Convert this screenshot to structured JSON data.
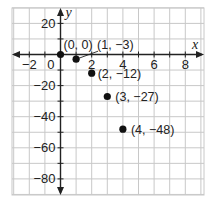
{
  "chart_data": {
    "type": "scatter",
    "title": "",
    "xlabel": "x",
    "ylabel": "y",
    "xlim": [
      -3,
      9
    ],
    "ylim": [
      -90,
      30
    ],
    "grid": true,
    "x_step": 1,
    "y_step": 10,
    "x_ticks": [
      -2,
      2,
      4,
      6,
      8
    ],
    "x_tick_labels": [
      "−2",
      "2",
      "4",
      "6",
      "8"
    ],
    "y_ticks": [
      20,
      -20,
      -40,
      -60,
      -80
    ],
    "y_tick_labels": [
      "20",
      "−20",
      "−40",
      "−60",
      "−80"
    ],
    "origin_label": "0",
    "points": [
      {
        "x": 0,
        "y": 0,
        "label": "(0, 0)"
      },
      {
        "x": 1,
        "y": -3,
        "label": "(1, −3)"
      },
      {
        "x": 2,
        "y": -12,
        "label": "(2, −12)"
      },
      {
        "x": 3,
        "y": -27,
        "label": "(3, −27)"
      },
      {
        "x": 4,
        "y": -48,
        "label": "(4, −48)"
      }
    ],
    "colors": {
      "grid": "#c8c8c8",
      "axis": "#222222",
      "point": "#111111"
    }
  }
}
